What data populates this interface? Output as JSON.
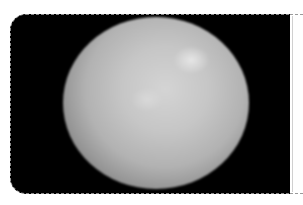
{
  "image": {
    "subject": "grayscale spherical celestial body",
    "background_color": "#000000",
    "page_background": "#ffffff",
    "frame_border_color": "#8a8a8a",
    "sphere_colors": {
      "highlight": "#e8e8e8",
      "mid": "#bdbdbd",
      "limb": "#4a4a4a"
    }
  }
}
